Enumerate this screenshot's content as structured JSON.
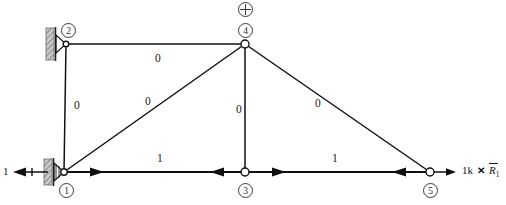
{
  "figure": {
    "type": "truss-virtual-unit-load-diagram",
    "width": 506,
    "height": 205,
    "line_color": "#111111",
    "node_fill": "#ffffff",
    "support_hatch_color": "#8a8a8a"
  },
  "nodes": [
    {
      "id": "1",
      "label": "1",
      "x": 62,
      "y": 172,
      "marker": "pin-support",
      "num_cx": 66,
      "num_cy": 190
    },
    {
      "id": "2",
      "label": "2",
      "x": 66,
      "y": 44,
      "marker": "roller-support",
      "num_cx": 68,
      "num_cy": 30
    },
    {
      "id": "3",
      "label": "3",
      "x": 245,
      "y": 172,
      "marker": "open-circle",
      "num_cx": 245,
      "num_cy": 190
    },
    {
      "id": "4",
      "label": "4",
      "x": 245,
      "y": 44,
      "marker": "open-circle",
      "num_cx": 245,
      "num_cy": 30
    },
    {
      "id": "5",
      "label": "5",
      "x": 430,
      "y": 172,
      "marker": "open-circle",
      "num_cx": 430,
      "num_cy": 190
    }
  ],
  "members": [
    {
      "id": "m-2-4",
      "from": "2",
      "to": "4",
      "label": "0",
      "label_x": 155,
      "label_y": 60,
      "arrow": "none"
    },
    {
      "id": "m-1-2",
      "from": "1",
      "to": "2",
      "label": "0",
      "label_x": 74,
      "label_y": 106,
      "arrow": "none"
    },
    {
      "id": "m-1-4",
      "from": "1",
      "to": "4",
      "label": "0",
      "label_x": 145,
      "label_y": 101,
      "arrow": "none"
    },
    {
      "id": "m-3-4",
      "from": "3",
      "to": "4",
      "label": "0",
      "label_x": 236,
      "label_y": 110,
      "arrow": "none"
    },
    {
      "id": "m-4-5",
      "from": "4",
      "to": "5",
      "label": "0",
      "label_x": 315,
      "label_y": 103,
      "arrow": "none"
    },
    {
      "id": "m-1-3",
      "from": "1",
      "to": "3",
      "label": "1",
      "label_x": 157,
      "label_y": 159,
      "arrow": "double-inward"
    },
    {
      "id": "m-3-5",
      "from": "3",
      "to": "5",
      "label": "1",
      "label_x": 332,
      "label_y": 159,
      "arrow": "double-inward"
    }
  ],
  "markers": {
    "crosshair": {
      "name": "origin-crosshair",
      "x": 245,
      "y": 8
    }
  },
  "forces": {
    "left": {
      "label": "1",
      "label_x": 3,
      "label_y": 166,
      "direction": "left",
      "arrow_from_x": 48,
      "arrow_to_x": 13,
      "y": 172
    },
    "right": {
      "magnitude": "1k",
      "multiply": "✕",
      "reaction": "R",
      "reaction_sub": "1",
      "label_x": 460,
      "label_y": 166,
      "direction": "right",
      "arrow_from_x": 430,
      "arrow_to_x": 455,
      "y": 172
    }
  }
}
